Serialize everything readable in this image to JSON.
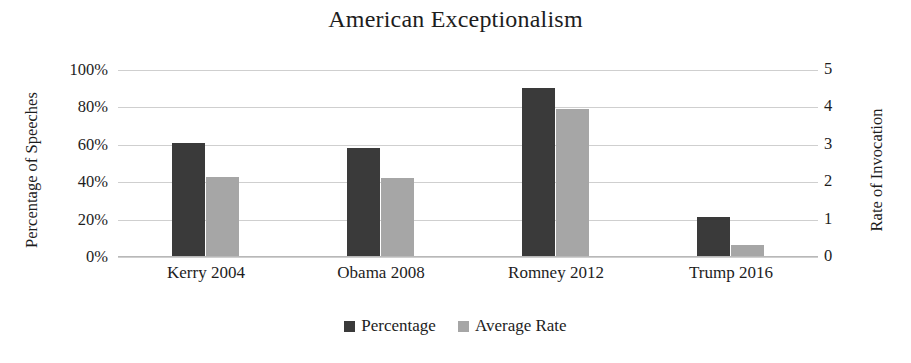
{
  "chart_data": {
    "type": "bar",
    "title": "American Exceptionalism",
    "categories": [
      "Kerry 2004",
      "Obama 2008",
      "Romney 2012",
      "Trump 2016"
    ],
    "series": [
      {
        "name": "Percentage",
        "axis": "left",
        "color": "#3a3a3a",
        "values": [
          61,
          58.5,
          90.5,
          21.5
        ],
        "unit": "%"
      },
      {
        "name": "Average Rate",
        "axis": "right",
        "color": "#a6a6a6",
        "values": [
          2.15,
          2.12,
          3.95,
          0.32
        ],
        "unit": ""
      }
    ],
    "xlabel": "",
    "ylabel": "Percentage of Speeches",
    "y2label": "Rate of Invocation",
    "ylim": [
      0,
      100
    ],
    "y2lim": [
      0,
      5
    ],
    "yticks": [
      "0%",
      "20%",
      "40%",
      "60%",
      "80%",
      "100%"
    ],
    "ytick_values": [
      0,
      20,
      40,
      60,
      80,
      100
    ],
    "y2ticks": [
      "0",
      "1",
      "2",
      "3",
      "4",
      "5"
    ],
    "y2tick_values": [
      0,
      1,
      2,
      3,
      4,
      5
    ],
    "grid": true,
    "legend_position": "bottom-center",
    "legend": [
      "Percentage",
      "Average Rate"
    ]
  },
  "axes": {
    "left_title": "Percentage of Speeches",
    "right_title": "Rate of Invocation"
  },
  "legend": {
    "items": [
      {
        "label": "Percentage",
        "color": "#3a3a3a",
        "icon": "square-marker-icon"
      },
      {
        "label": "Average Rate",
        "color": "#a6a6a6",
        "icon": "square-marker-icon"
      }
    ]
  },
  "colors": {
    "series_percentage": "#3a3a3a",
    "series_average_rate": "#a6a6a6",
    "gridline": "#cfcfcf",
    "text": "#1d1d1d",
    "background": "#ffffff"
  }
}
